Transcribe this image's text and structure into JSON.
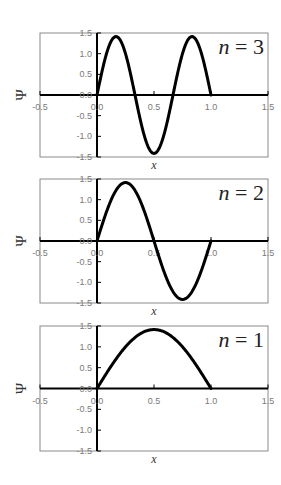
{
  "chart_data": [
    {
      "type": "line",
      "title": "n = 3",
      "label_var": "n",
      "label_eq": " = ",
      "label_val": "3",
      "n": 3,
      "xlabel": "x",
      "ylabel": "Ψ",
      "xlim": [
        -0.5,
        1.5
      ],
      "ylim": [
        -1.5,
        1.5
      ],
      "xticks": [
        "-0.5",
        "0.0",
        "0.5",
        "1.0",
        "1.5"
      ],
      "yticks": [
        "1.5",
        "1.0",
        "0.5",
        "0.0",
        "-0.5",
        "-1.0",
        "-1.5"
      ],
      "grid": false,
      "series": [
        {
          "name": "Ψ (n=3)",
          "function": "1.414*sin(3πx)",
          "x": [
            0,
            0.1667,
            0.3333,
            0.5,
            0.6667,
            0.8333,
            1.0
          ],
          "y": [
            0,
            1.41,
            0,
            -1.41,
            0,
            1.41,
            0
          ]
        }
      ]
    },
    {
      "type": "line",
      "title": "n = 2",
      "label_var": "n",
      "label_eq": " = ",
      "label_val": "2",
      "n": 2,
      "xlabel": "x",
      "ylabel": "Ψ",
      "xlim": [
        -0.5,
        1.5
      ],
      "ylim": [
        -1.5,
        1.5
      ],
      "xticks": [
        "-0.5",
        "0.0",
        "0.5",
        "1.0",
        "1.5"
      ],
      "yticks": [
        "1.5",
        "1.0",
        "0.5",
        "0.0",
        "-0.5",
        "-1.0",
        "-1.5"
      ],
      "grid": false,
      "series": [
        {
          "name": "Ψ (n=2)",
          "function": "1.414*sin(2πx)",
          "x": [
            0,
            0.25,
            0.5,
            0.75,
            1.0
          ],
          "y": [
            0,
            1.41,
            0,
            -1.41,
            0
          ]
        }
      ]
    },
    {
      "type": "line",
      "title": "n = 1",
      "label_var": "n",
      "label_eq": " = ",
      "label_val": "1",
      "n": 1,
      "xlabel": "x",
      "ylabel": "Ψ",
      "xlim": [
        -0.5,
        1.5
      ],
      "ylim": [
        -1.5,
        1.5
      ],
      "xticks": [
        "-0.5",
        "0.0",
        "0.5",
        "1.0",
        "1.5"
      ],
      "yticks": [
        "1.5",
        "1.0",
        "0.5",
        "0.0",
        "-0.5",
        "-1.0",
        "-1.5"
      ],
      "grid": false,
      "series": [
        {
          "name": "Ψ (n=1)",
          "function": "1.414*sin(πx)",
          "x": [
            0,
            0.5,
            1.0
          ],
          "y": [
            0,
            1.41,
            0
          ]
        }
      ]
    }
  ],
  "amplitude": 1.414
}
